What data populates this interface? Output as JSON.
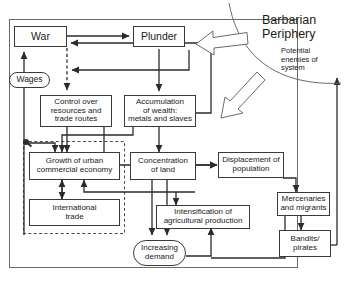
{
  "diagram": {
    "title_region": {
      "heading": "Barbarian\nPeriphery",
      "subtext": "Potential\nenemies of\nsystem"
    },
    "nodes": [
      {
        "id": "war",
        "label": "War"
      },
      {
        "id": "plunder",
        "label": "Plunder"
      },
      {
        "id": "wages",
        "label": "Wages"
      },
      {
        "id": "control",
        "label": "Control over\nresources and\ntrade routes"
      },
      {
        "id": "accumulation",
        "label": "Accumulation\nof wealth:\nmetals and slaves"
      },
      {
        "id": "growth",
        "label": "Growth of urban\ncommercial economy"
      },
      {
        "id": "concentration",
        "label": "Concentration\nof land"
      },
      {
        "id": "displacement",
        "label": "Displacement of\npopulation"
      },
      {
        "id": "intltrade",
        "label": "International\ntrade"
      },
      {
        "id": "intensification",
        "label": "Intensification of\nagricultural production"
      },
      {
        "id": "mercenaries",
        "label": "Mercenaries\nand migrants"
      },
      {
        "id": "bandits",
        "label": "Bandits/\npirates"
      },
      {
        "id": "demand",
        "label": "Increasing\ndemand"
      }
    ],
    "colors": {
      "stroke": "#3a3a3a",
      "text": "#1a1a1a",
      "background": "#ffffff"
    }
  }
}
